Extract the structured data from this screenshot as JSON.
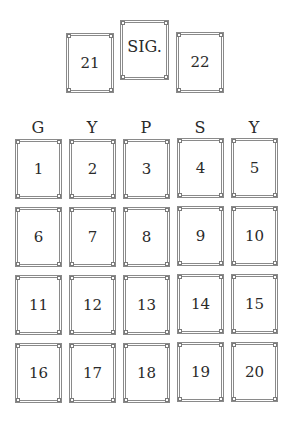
{
  "top_cards": [
    {
      "id": "21",
      "label": "21"
    },
    {
      "id": "sig",
      "label": "SIG."
    },
    {
      "id": "22",
      "label": "22"
    }
  ],
  "column_headers": [
    "G",
    "Y",
    "P",
    "S",
    "Y"
  ],
  "grid": {
    "rows": [
      [
        "1",
        "2",
        "3",
        "4",
        "5"
      ],
      [
        "6",
        "7",
        "8",
        "9",
        "10"
      ],
      [
        "11",
        "12",
        "13",
        "14",
        "15"
      ],
      [
        "16",
        "17",
        "18",
        "19",
        "20"
      ]
    ]
  },
  "colors": {
    "border": "#8a8a8a",
    "text": "#2a2a2a",
    "background": "#ffffff"
  }
}
